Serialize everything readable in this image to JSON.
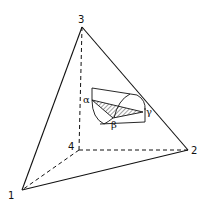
{
  "diagram": {
    "vertices": [
      {
        "id": "1",
        "label": "1",
        "x": 22,
        "y": 190
      },
      {
        "id": "2",
        "label": "2",
        "x": 188,
        "y": 150
      },
      {
        "id": "3",
        "label": "3",
        "x": 82,
        "y": 27
      },
      {
        "id": "4",
        "label": "4",
        "x": 79,
        "y": 150
      }
    ],
    "edges_solid": [
      [
        "1",
        "3"
      ],
      [
        "3",
        "2"
      ],
      [
        "1",
        "2"
      ]
    ],
    "edges_hidden": [
      [
        "4",
        "1"
      ],
      [
        "4",
        "2"
      ],
      [
        "4",
        "3"
      ]
    ],
    "phase_labels": {
      "alpha": "α",
      "beta": "β",
      "gamma": "γ"
    }
  }
}
